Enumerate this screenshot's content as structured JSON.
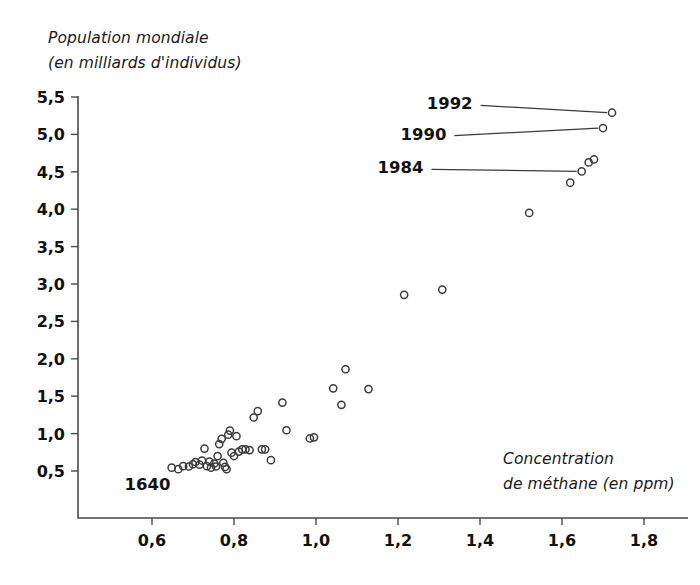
{
  "chart_data": {
    "type": "scatter",
    "title": "",
    "xlabel": "Concentration de méthane (en ppm)",
    "ylabel": "Population mondiale (en milliards d'individus)",
    "ylabel_line1": "Population mondiale",
    "ylabel_line2": "(en milliards d'individus)",
    "xlabel_line1": "Concentration",
    "xlabel_line2": "de méthane (en ppm)",
    "xlim": [
      0.52,
      1.86
    ],
    "ylim": [
      0.24,
      5.72
    ],
    "xticks": [
      0.6,
      0.8,
      1.0,
      1.2,
      1.4,
      1.6,
      1.8
    ],
    "yticks": [
      0.5,
      1.0,
      1.5,
      2.0,
      2.5,
      3.0,
      3.5,
      4.0,
      4.5,
      5.0,
      5.5
    ],
    "xtick_labels": [
      "0,6",
      "0,8",
      "1,0",
      "1,2",
      "1,4",
      "1,6",
      "1,8"
    ],
    "ytick_labels": [
      "0,5",
      "1,0",
      "1,5",
      "2,0",
      "2,5",
      "3,0",
      "3,5",
      "4,0",
      "4,5",
      "5,0",
      "5,5"
    ],
    "grid": false,
    "legend": false,
    "marker": "open-circle",
    "marker_color": "#3b3b3b",
    "points": [
      [
        0.648,
        0.545
      ],
      [
        0.664,
        0.525
      ],
      [
        0.676,
        0.565
      ],
      [
        0.69,
        0.56
      ],
      [
        0.7,
        0.59
      ],
      [
        0.706,
        0.62
      ],
      [
        0.716,
        0.585
      ],
      [
        0.722,
        0.64
      ],
      [
        0.728,
        0.8
      ],
      [
        0.734,
        0.565
      ],
      [
        0.74,
        0.625
      ],
      [
        0.744,
        0.545
      ],
      [
        0.752,
        0.6
      ],
      [
        0.756,
        0.56
      ],
      [
        0.76,
        0.7
      ],
      [
        0.764,
        0.86
      ],
      [
        0.77,
        0.93
      ],
      [
        0.774,
        0.61
      ],
      [
        0.778,
        0.555
      ],
      [
        0.782,
        0.525
      ],
      [
        0.786,
        0.985
      ],
      [
        0.79,
        1.04
      ],
      [
        0.794,
        0.745
      ],
      [
        0.8,
        0.7
      ],
      [
        0.806,
        0.965
      ],
      [
        0.812,
        0.76
      ],
      [
        0.82,
        0.79
      ],
      [
        0.828,
        0.79
      ],
      [
        0.838,
        0.78
      ],
      [
        0.848,
        1.215
      ],
      [
        0.858,
        1.3
      ],
      [
        0.868,
        0.79
      ],
      [
        0.876,
        0.79
      ],
      [
        0.89,
        0.645
      ],
      [
        0.918,
        1.415
      ],
      [
        0.928,
        1.045
      ],
      [
        0.985,
        0.935
      ],
      [
        0.995,
        0.95
      ],
      [
        1.042,
        1.605
      ],
      [
        1.062,
        1.385
      ],
      [
        1.072,
        1.86
      ],
      [
        1.128,
        1.595
      ],
      [
        1.215,
        2.855
      ],
      [
        1.308,
        2.925
      ],
      [
        1.52,
        3.95
      ],
      [
        1.62,
        4.355
      ],
      [
        1.648,
        4.505
      ],
      [
        1.665,
        4.625
      ],
      [
        1.678,
        4.665
      ],
      [
        1.7,
        5.085
      ],
      [
        1.722,
        5.29
      ]
    ],
    "annotations": [
      {
        "label": "1992",
        "point": [
          1.722,
          5.29
        ],
        "text_x": 1.382,
        "text_y": 5.415
      },
      {
        "label": "1990",
        "point": [
          1.7,
          5.085
        ],
        "text_x": 1.318,
        "text_y": 5.01
      },
      {
        "label": "1984",
        "point": [
          1.648,
          4.505
        ],
        "text_x": 1.262,
        "text_y": 4.56
      },
      {
        "label": "1640",
        "point": null,
        "text_x": 0.645,
        "text_y": 0.33
      }
    ]
  }
}
